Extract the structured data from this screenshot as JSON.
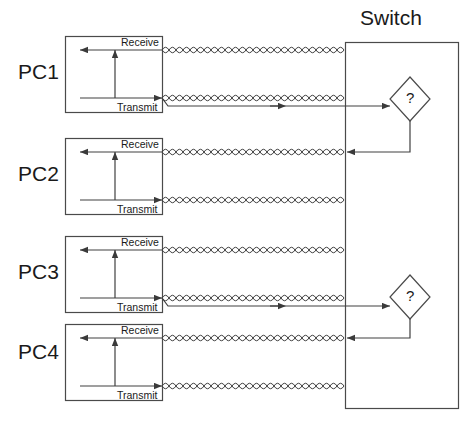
{
  "diagram": {
    "title_visible": false,
    "colors": {
      "stroke": "#404040",
      "box_stroke": "#4a4a4a",
      "text": "#1a1a1a",
      "background": "#ffffff"
    },
    "switch": {
      "label": "Switch",
      "label_x": 360,
      "label_y": 6,
      "box": {
        "x": 345,
        "y": 42,
        "w": 113,
        "h": 366
      }
    },
    "pcs": [
      {
        "name": "PC1",
        "label_x": 18,
        "label_y": 60,
        "box": {
          "x": 65,
          "y": 36,
          "w": 97,
          "h": 76
        },
        "receive_label": "Receive",
        "transmit_label": "Transmit",
        "receive_y": 50,
        "transmit_y": 98,
        "has_transmit_run": true,
        "has_receive_return": false
      },
      {
        "name": "PC2",
        "label_x": 18,
        "label_y": 162,
        "box": {
          "x": 65,
          "y": 138,
          "w": 97,
          "h": 76
        },
        "receive_label": "Receive",
        "transmit_label": "Transmit",
        "receive_y": 152,
        "transmit_y": 200,
        "has_transmit_run": false,
        "has_receive_return": true
      },
      {
        "name": "PC3",
        "label_x": 18,
        "label_y": 260,
        "box": {
          "x": 65,
          "y": 236,
          "w": 97,
          "h": 76
        },
        "receive_label": "Receive",
        "transmit_label": "Transmit",
        "receive_y": 250,
        "transmit_y": 298,
        "has_transmit_run": true,
        "has_receive_return": false
      },
      {
        "name": "PC4",
        "label_x": 18,
        "label_y": 340,
        "box": {
          "x": 65,
          "y": 324,
          "w": 97,
          "h": 76
        },
        "receive_label": "Receive",
        "transmit_label": "Transmit",
        "receive_y": 338,
        "transmit_y": 386,
        "has_transmit_run": false,
        "has_receive_return": true
      }
    ],
    "decision_nodes": [
      {
        "symbol": "?",
        "cx": 410,
        "cy": 99,
        "rx": 20,
        "ry": 22,
        "feeds_from": "PC1",
        "returns_to": "PC2"
      },
      {
        "symbol": "?",
        "cx": 410,
        "cy": 297,
        "rx": 20,
        "ry": 22,
        "feeds_from": "PC3",
        "returns_to": "PC4"
      }
    ],
    "cable": {
      "type": "twisted-pair",
      "x_start": 162,
      "x_end": 345,
      "loop_width": 7,
      "loop_height": 11
    }
  }
}
